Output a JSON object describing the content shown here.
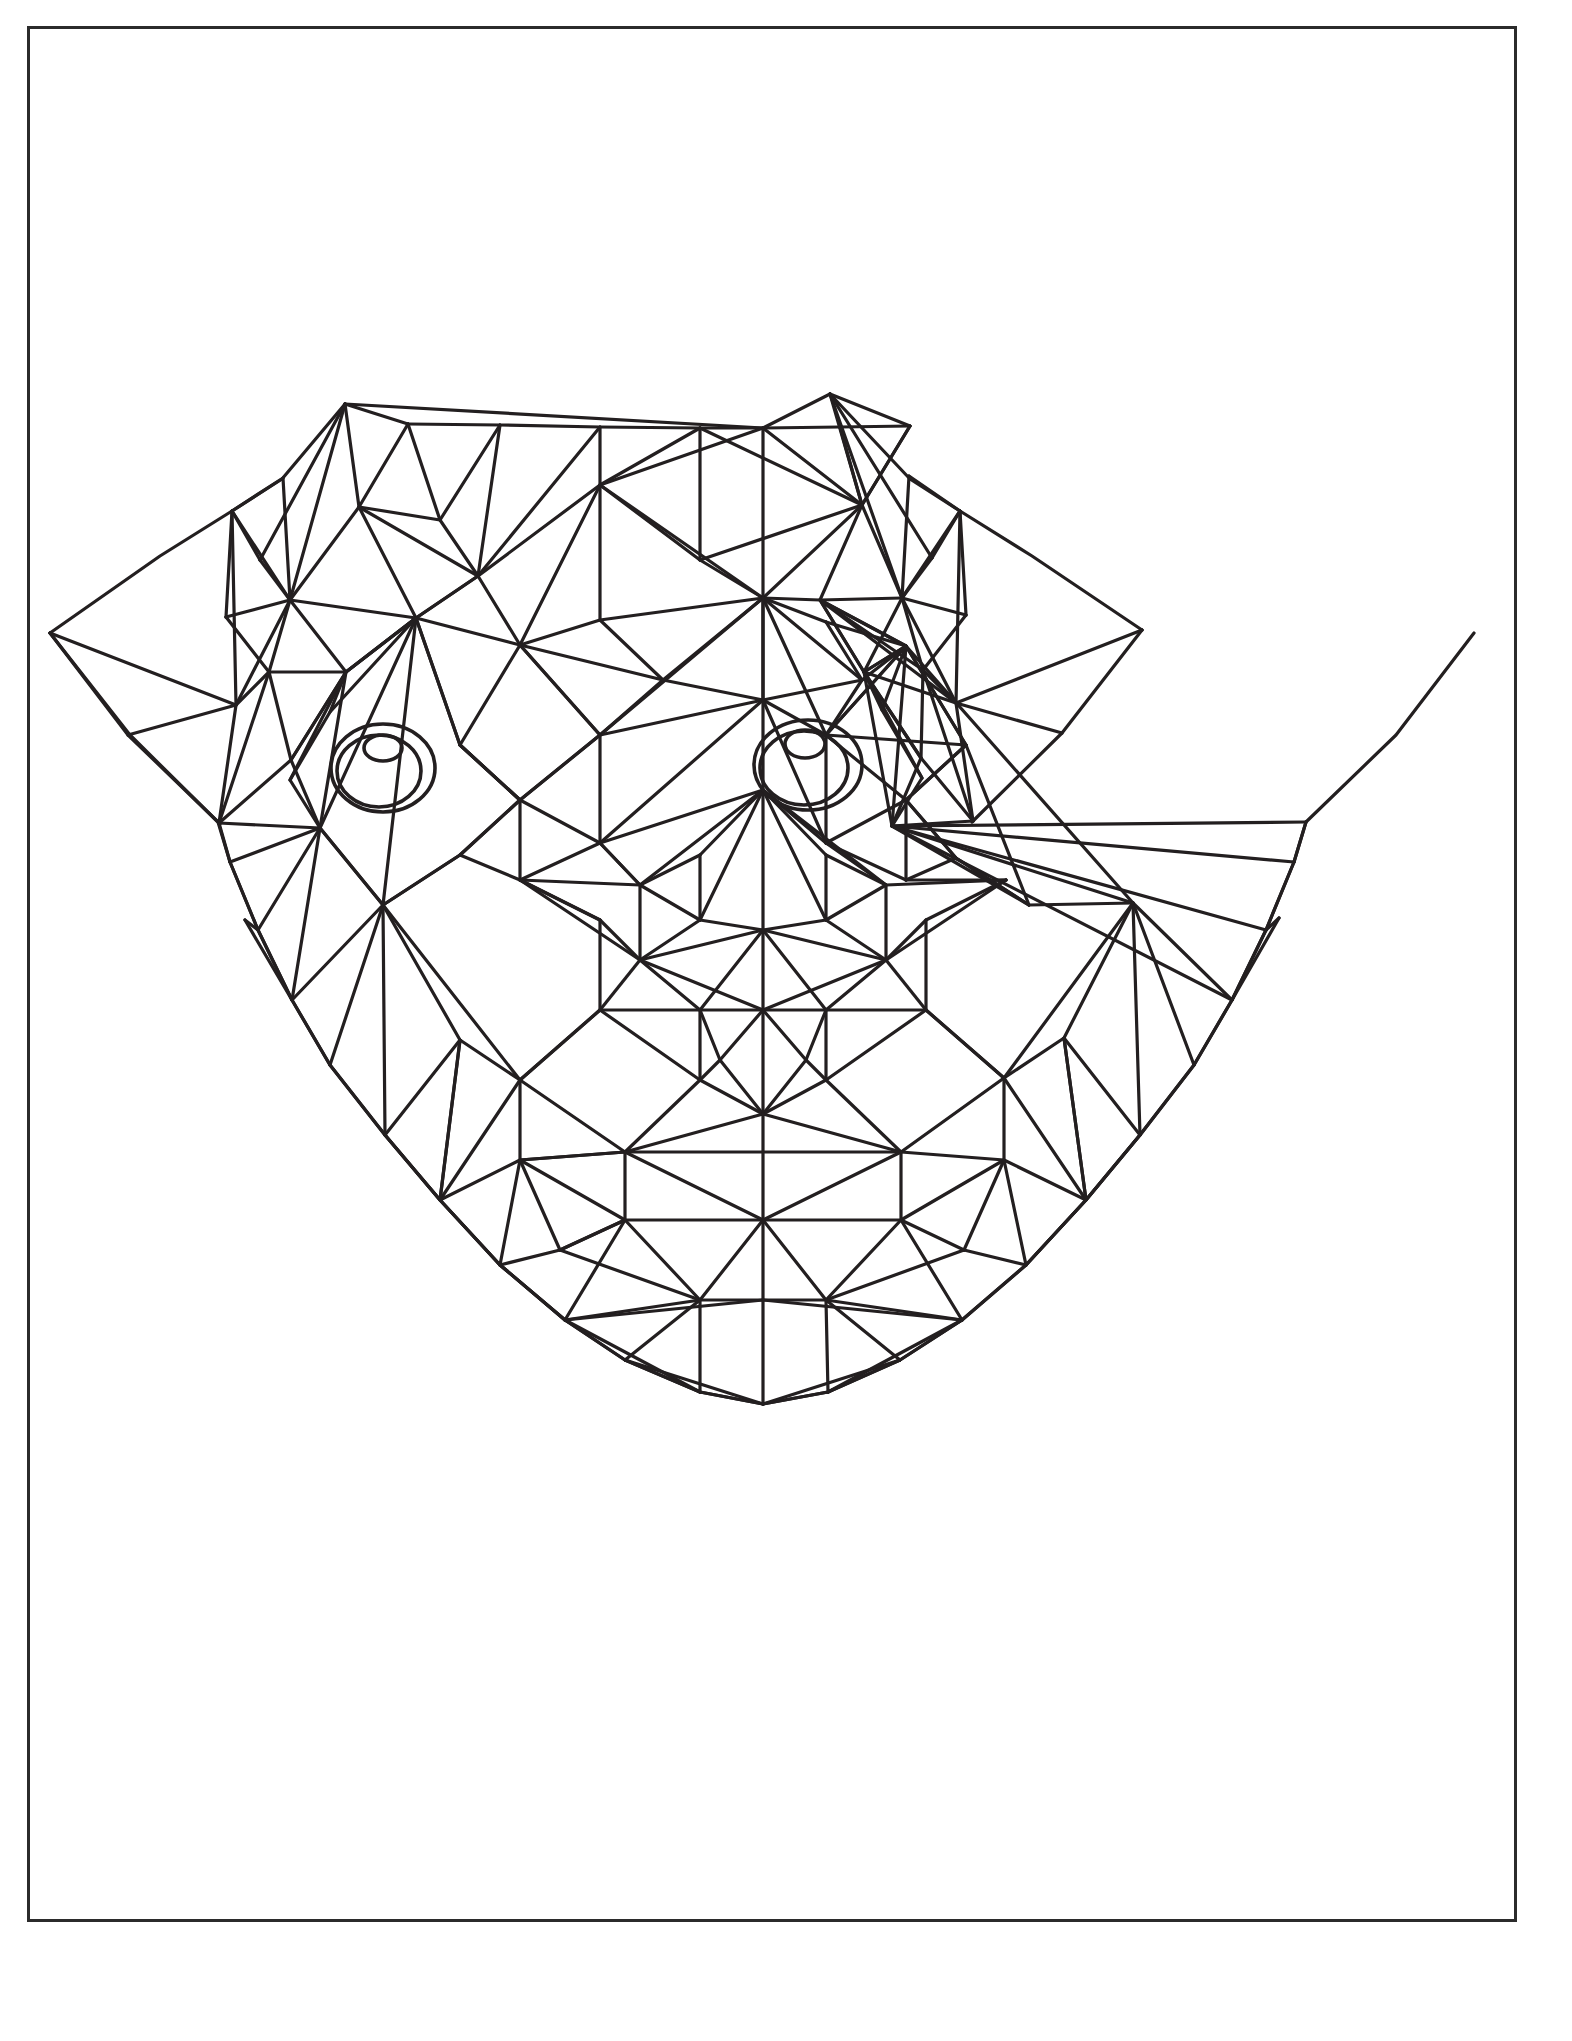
{
  "page": {
    "title": "Geometric Pug Dog Face Coloring Page",
    "background_color": "#ffffff",
    "border_color": "#2b2b2b",
    "line_color": "#231f20",
    "width": 1572,
    "height": 2041
  },
  "border": {
    "name": "page-border",
    "x": 27,
    "y": 26,
    "width": 1490,
    "height": 1896,
    "stroke_width": 3
  },
  "artwork": {
    "name": "geometric-pug-face",
    "subject": "pug dog head",
    "style": "low-poly line art / coloring book outline",
    "stroke_width": 3.2,
    "symmetry": "bilateral about vertical center axis x=763",
    "bounds": {
      "x": 50,
      "y": 390,
      "width": 1095,
      "height": 740
    },
    "features": {
      "left_ear_tip": [
        50,
        633
      ],
      "right_ear_tip": [
        1142,
        630
      ],
      "crown_left": [
        345,
        404
      ],
      "crown_right": [
        830,
        394
      ],
      "chin_bottom": [
        625,
        1114
      ],
      "center_axis_x": 763
    },
    "eyes": [
      {
        "name": "left-eye",
        "outer_ellipse": {
          "cx": 383,
          "cy": 768,
          "rx": 52,
          "ry": 44
        },
        "inner_ellipse": {
          "cx": 379,
          "cy": 771,
          "rx": 42,
          "ry": 36
        },
        "pupil_ellipse": {
          "cx": 383,
          "cy": 748,
          "rx": 19,
          "ry": 13
        }
      },
      {
        "name": "right-eye",
        "outer_ellipse": {
          "cx": 808,
          "cy": 765,
          "rx": 54,
          "ry": 45
        },
        "inner_ellipse": {
          "cx": 804,
          "cy": 768,
          "rx": 44,
          "ry": 37
        },
        "pupil_ellipse": {
          "cx": 805,
          "cy": 744,
          "rx": 20,
          "ry": 14
        }
      }
    ]
  }
}
